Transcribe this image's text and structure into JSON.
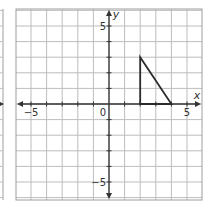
{
  "chart_data": {
    "type": "line",
    "title": "",
    "xlabel": "x",
    "ylabel": "y",
    "xlim": [
      -6,
      6
    ],
    "ylim": [
      -6,
      6
    ],
    "grid": true,
    "grid_step": 1,
    "x_tick_labels": [
      {
        "value": -5,
        "label": "−5"
      },
      {
        "value": 0,
        "label": "0"
      },
      {
        "value": 5,
        "label": "5"
      }
    ],
    "y_tick_labels": [
      {
        "value": 5,
        "label": "5"
      },
      {
        "value": -5,
        "label": "−5"
      }
    ],
    "series": [
      {
        "name": "triangle",
        "shape": "polygon",
        "points": [
          [
            2,
            3
          ],
          [
            2,
            0
          ],
          [
            4,
            0
          ]
        ]
      }
    ],
    "colors": {
      "grid": "#bdbdbd",
      "axis": "#333333",
      "shape": "#2b2b2b",
      "border": "#9e9e9e",
      "background": "#ffffff"
    }
  },
  "layout": {
    "origin_px": [
      109,
      104
    ],
    "unit_px": 15.6,
    "panel": {
      "left": 16,
      "top": 9,
      "right": 202,
      "bottom": 200
    },
    "left_partial_panel": {
      "right_edge_px": 3
    }
  }
}
